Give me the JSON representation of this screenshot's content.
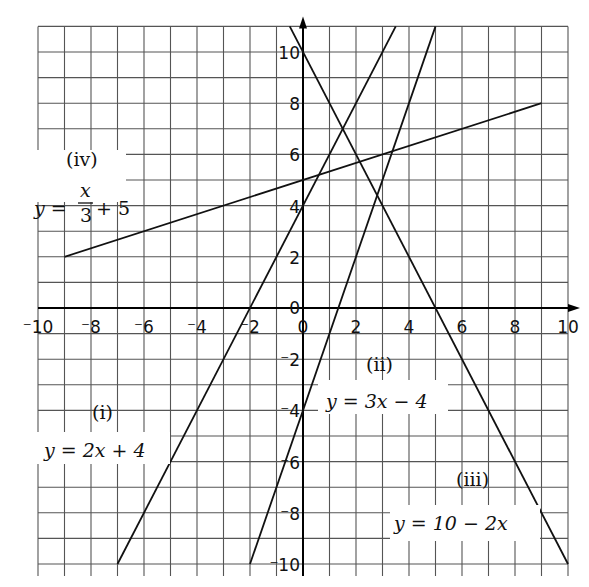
{
  "chart_data": {
    "type": "line",
    "title": "",
    "xlabel": "",
    "ylabel": "",
    "xlim": [
      -10,
      10
    ],
    "ylim": [
      -10,
      11
    ],
    "grid": true,
    "x_ticks": [
      "-10",
      "-8",
      "-6",
      "-4",
      "-2",
      "0",
      "2",
      "4",
      "6",
      "8",
      "10"
    ],
    "y_ticks": [
      "10",
      "8",
      "6",
      "4",
      "2",
      "0",
      "-2",
      "-4",
      "-6",
      "-8",
      "-10"
    ],
    "series": [
      {
        "name": "(i)",
        "equation": "y = 2x + 4",
        "points": [
          [
            -7,
            -10
          ],
          [
            3.5,
            11
          ]
        ]
      },
      {
        "name": "(ii)",
        "equation": "y = 3x - 4",
        "points": [
          [
            -2,
            -10
          ],
          [
            5,
            11
          ]
        ]
      },
      {
        "name": "(iii)",
        "equation": "y = 10 - 2x",
        "points": [
          [
            -0.5,
            11
          ],
          [
            10,
            -10
          ]
        ]
      },
      {
        "name": "(iv)",
        "equation": "y = x/3 + 5",
        "points": [
          [
            -9,
            2
          ],
          [
            9,
            8
          ]
        ]
      }
    ],
    "labels": {
      "i": {
        "tag": "(i)",
        "eq": "y = 2x + 4"
      },
      "ii": {
        "tag": "(ii)",
        "eq": "y = 3x − 4"
      },
      "iii": {
        "tag": "(iii)",
        "eq": "y = 10 − 2x"
      },
      "iv": {
        "tag": "(iv)",
        "eq_lhs": "y =",
        "eq_num": "x",
        "eq_den": "3",
        "eq_rhs": "+ 5"
      }
    }
  }
}
